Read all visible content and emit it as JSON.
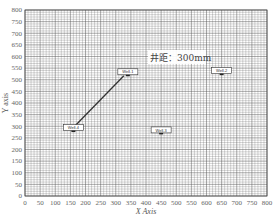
{
  "chart_data": {
    "type": "scatter",
    "title": "",
    "xlabel": "X Axis",
    "ylabel": "Y axis",
    "xlim": [
      0,
      800
    ],
    "ylim": [
      0,
      800
    ],
    "grid": true,
    "grid_minor_step": 10,
    "x_ticks": [
      0,
      50,
      100,
      150,
      200,
      250,
      300,
      350,
      400,
      450,
      500,
      550,
      600,
      650,
      700,
      750,
      800
    ],
    "y_ticks": [
      0,
      50,
      100,
      150,
      200,
      250,
      300,
      350,
      400,
      450,
      500,
      550,
      600,
      650,
      700,
      750,
      800
    ],
    "points": [
      {
        "name": "Well-1",
        "x": 340,
        "y": 530
      },
      {
        "name": "Well-2",
        "x": 650,
        "y": 535
      },
      {
        "name": "Well-3",
        "x": 450,
        "y": 280
      },
      {
        "name": "Well-4",
        "x": 160,
        "y": 290
      }
    ],
    "annotations": [
      {
        "text": "井距：300mm",
        "x": 400,
        "y": 590,
        "type": "text-box"
      },
      {
        "type": "line",
        "from": "Well-1",
        "to": "Well-4"
      }
    ],
    "colors": {
      "grid": "#555555",
      "line": "#333333",
      "background": "#ffffff"
    }
  }
}
